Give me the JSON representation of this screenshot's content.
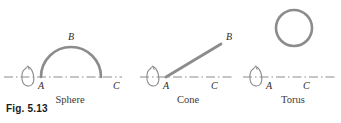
{
  "figure": {
    "caption": "Fig. 5.13",
    "background_color": "#ffffff",
    "stroke_color": "#8c8c8c",
    "axis_color": "#8c8c8c",
    "label_color": "#2b2b2b"
  },
  "panels": [
    {
      "name": "sphere",
      "title": "Sphere",
      "generator": "semicircular arc from A to C with apex B",
      "axis": {
        "style": "dash-dot",
        "x_start": 4,
        "x_end": 122,
        "y": 77
      },
      "rotation_arrow": {
        "name": "rotation-arrow",
        "cx": 30,
        "cy": 77,
        "rx": 7,
        "ry": 12
      },
      "points": [
        {
          "label": "A",
          "x": 41,
          "y": 77,
          "label_x": 38,
          "label_y": 89
        },
        {
          "label": "B",
          "x": 71,
          "y": 47,
          "label_x": 68,
          "label_y": 40
        },
        {
          "label": "C",
          "x": 101,
          "y": 77,
          "label_x": 113,
          "label_y": 89
        }
      ],
      "title_x": 70,
      "title_y": 103
    },
    {
      "name": "cone",
      "title": "Cone",
      "generator": "straight slanted line from A to B",
      "axis": {
        "style": "dash-dot",
        "x_start": 140,
        "x_end": 232,
        "y": 77
      },
      "rotation_arrow": {
        "name": "rotation-arrow",
        "cx": 155,
        "cy": 77,
        "rx": 7,
        "ry": 12
      },
      "points": [
        {
          "label": "A",
          "x": 166,
          "y": 77,
          "label_x": 163,
          "label_y": 89
        },
        {
          "label": "B",
          "x": 221,
          "y": 44,
          "label_x": 226,
          "label_y": 40
        },
        {
          "label": "C",
          "x": 213,
          "y": 77,
          "label_x": 211,
          "label_y": 89
        }
      ],
      "title_x": 188,
      "title_y": 103
    },
    {
      "name": "torus",
      "title": "Torus",
      "generator": "circle above the axis",
      "axis": {
        "style": "dash-dot",
        "x_start": 243,
        "x_end": 337,
        "y": 77
      },
      "rotation_arrow": {
        "name": "rotation-arrow",
        "cx": 258,
        "cy": 77,
        "rx": 7,
        "ry": 12
      },
      "circle": {
        "cx": 294,
        "cy": 28,
        "r": 18
      },
      "points": [
        {
          "label": "A",
          "x": 269,
          "y": 77,
          "label_x": 266,
          "label_y": 89
        },
        {
          "label": "C",
          "x": 306,
          "y": 77,
          "label_x": 303,
          "label_y": 89
        }
      ],
      "title_x": 293,
      "title_y": 103
    }
  ]
}
